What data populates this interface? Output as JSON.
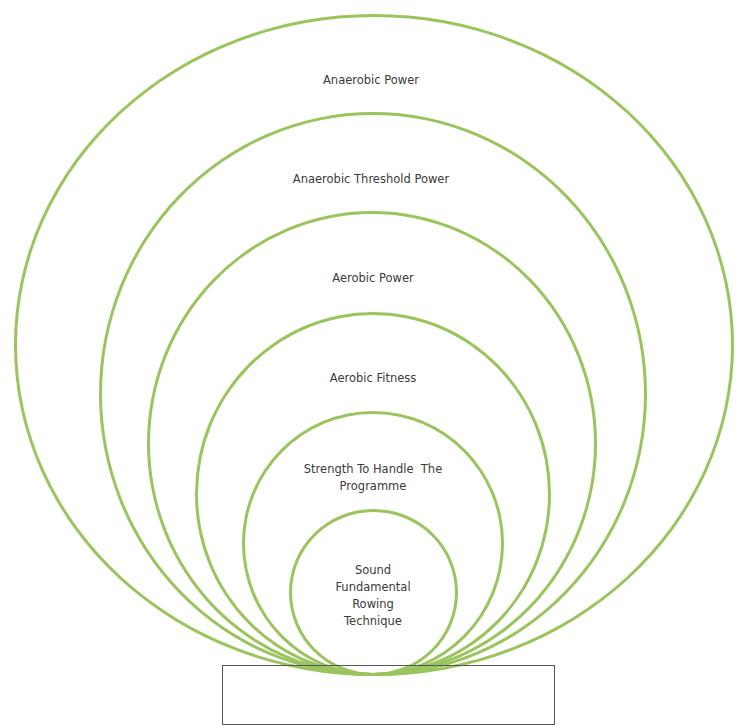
{
  "diagram": {
    "type": "nested-circles",
    "stroke_color": "#9bc45e",
    "levels": [
      {
        "label": "Anaerobic Power"
      },
      {
        "label": "Anaerobic Threshold Power"
      },
      {
        "label": "Aerobic Power"
      },
      {
        "label": "Aerobic Fitness"
      },
      {
        "label_line1": "Strength To Handle  The",
        "label_line2": "Programme"
      },
      {
        "label_line1": "Sound",
        "label_line2": "Fundamental",
        "label_line3": "Rowing",
        "label_line4": "Technique"
      }
    ]
  }
}
